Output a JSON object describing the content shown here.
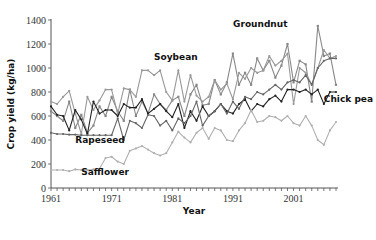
{
  "chart_data": {
    "type": "line",
    "title": "",
    "xlabel": "Year",
    "ylabel": "Crop yield (kg/ha)",
    "xlim": [
      1961,
      2008
    ],
    "ylim": [
      0,
      1400
    ],
    "x_ticks": [
      1961,
      1971,
      1981,
      1991,
      2001
    ],
    "y_ticks": [
      0,
      200,
      400,
      600,
      800,
      1000,
      1200,
      1400
    ],
    "grid": false,
    "legend": "inline labels",
    "x": [
      1961,
      1962,
      1963,
      1964,
      1965,
      1966,
      1967,
      1968,
      1969,
      1970,
      1971,
      1972,
      1973,
      1974,
      1975,
      1976,
      1977,
      1978,
      1979,
      1980,
      1981,
      1982,
      1983,
      1984,
      1985,
      1986,
      1987,
      1988,
      1989,
      1990,
      1991,
      1992,
      1993,
      1994,
      1995,
      1996,
      1997,
      1998,
      1999,
      2000,
      2001,
      2002,
      2003,
      2004,
      2005,
      2006,
      2007,
      2008
    ],
    "series": [
      {
        "name": "Groundnut",
        "color": "#888888",
        "marker": "square",
        "values": [
          640,
          600,
          560,
          720,
          500,
          610,
          460,
          520,
          680,
          600,
          760,
          640,
          560,
          820,
          600,
          720,
          620,
          780,
          700,
          650,
          730,
          760,
          600,
          780,
          860,
          690,
          700,
          900,
          780,
          880,
          1120,
          860,
          960,
          860,
          1080,
          980,
          1060,
          920,
          1020,
          1200,
          880,
          1060,
          1030,
          720,
          1350,
          1100,
          1120,
          860
        ]
      },
      {
        "name": "Soybean",
        "color": "#999999",
        "marker": "circle",
        "values": [
          720,
          700,
          760,
          810,
          620,
          450,
          760,
          650,
          730,
          820,
          820,
          620,
          830,
          820,
          760,
          980,
          980,
          940,
          980,
          800,
          730,
          980,
          720,
          940,
          770,
          720,
          760,
          900,
          820,
          870,
          740,
          960,
          910,
          1000,
          960,
          980,
          1100,
          1020,
          1060,
          1120,
          700,
          1000,
          960,
          860,
          1000,
          1150,
          1080,
          1100
        ]
      },
      {
        "name": "Chick pea",
        "color": "#222222",
        "marker": "circle",
        "values": [
          680,
          610,
          600,
          480,
          650,
          570,
          450,
          720,
          620,
          650,
          650,
          600,
          700,
          670,
          670,
          740,
          620,
          660,
          700,
          640,
          590,
          700,
          500,
          640,
          560,
          680,
          600,
          640,
          700,
          640,
          620,
          700,
          740,
          640,
          700,
          680,
          740,
          770,
          720,
          820,
          820,
          800,
          820,
          780,
          820,
          700,
          800,
          800
        ]
      },
      {
        "name": "Rapeseed",
        "color": "#666666",
        "marker": "circle",
        "values": [
          460,
          450,
          450,
          445,
          445,
          440,
          440,
          440,
          440,
          440,
          440,
          580,
          400,
          560,
          540,
          500,
          610,
          600,
          520,
          560,
          480,
          580,
          540,
          600,
          720,
          520,
          600,
          640,
          700,
          620,
          720,
          660,
          760,
          740,
          800,
          780,
          820,
          860,
          820,
          880,
          900,
          880,
          940,
          860,
          1000,
          1060,
          1080,
          1080
        ]
      },
      {
        "name": "Safflower",
        "color": "#b0b0b0",
        "marker": "circle",
        "values": [
          150,
          150,
          150,
          140,
          155,
          150,
          150,
          155,
          160,
          250,
          260,
          220,
          200,
          310,
          330,
          350,
          320,
          290,
          270,
          290,
          380,
          470,
          420,
          380,
          460,
          500,
          410,
          500,
          480,
          400,
          390,
          480,
          540,
          650,
          550,
          560,
          600,
          590,
          560,
          600,
          540,
          520,
          600,
          520,
          400,
          360,
          480,
          550
        ]
      }
    ],
    "annotations": [
      {
        "text": "Groundnut",
        "x": 2000,
        "y": 1340
      },
      {
        "text": "Soybean",
        "x": 1978,
        "y": 1070
      },
      {
        "text": "Chick pea",
        "x": 2006,
        "y": 720
      },
      {
        "text": "Rapeseed",
        "x": 1965,
        "y": 375
      },
      {
        "text": "Safflower",
        "x": 1966,
        "y": 110
      }
    ]
  }
}
